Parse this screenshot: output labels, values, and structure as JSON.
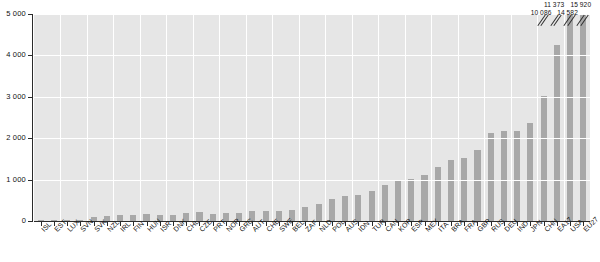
{
  "chart_data": {
    "type": "bar",
    "title": "",
    "subtitle": "",
    "xlabel": "",
    "ylabel": "",
    "ylim": [
      0,
      5000
    ],
    "grid": true,
    "legend": "none",
    "y_ticks": [
      "0",
      "1 000",
      "2 000",
      "3 000",
      "4 000",
      "5 000"
    ],
    "y_tick_values": [
      0,
      1000,
      2000,
      3000,
      4000,
      5000
    ],
    "bar_color": "#a8a8a8",
    "plot_background": "#e6e6e6",
    "gridline_color": "#ffffff",
    "axis_color": "#2b2b2b",
    "categories": [
      "ISL",
      "EST",
      "LUX",
      "SVN",
      "SVK",
      "NZL",
      "IRL",
      "FIN",
      "HUN",
      "ISR",
      "DNK",
      "CHL",
      "CZE",
      "PRT",
      "NOR",
      "GRC",
      "AUT",
      "CHE",
      "SWE",
      "BEL",
      "ZAF",
      "NLD",
      "POL",
      "AUS",
      "IDN",
      "TUR",
      "CAN",
      "KOR",
      "ESP",
      "MEX",
      "ITA",
      "BRA",
      "FRA",
      "GBR",
      "RUS",
      "DEU",
      "IND",
      "JPN",
      "CHN",
      "EA17",
      "USA",
      "EU27"
    ],
    "values": [
      12,
      18,
      22,
      30,
      95,
      110,
      145,
      150,
      160,
      140,
      150,
      185,
      215,
      180,
      190,
      205,
      230,
      235,
      250,
      255,
      340,
      420,
      540,
      610,
      640,
      720,
      860,
      960,
      1010,
      1115,
      1300,
      1480,
      1530,
      1720,
      2130,
      2170,
      2180,
      2360,
      3020,
      4250,
      5000,
      5000
    ],
    "clipped_bars": [
      {
        "category": "CHN",
        "index": 38,
        "label": "10 086"
      },
      {
        "category": "EA17",
        "index": 39,
        "label": "11 373"
      },
      {
        "category": "USA",
        "index": 40,
        "label": "14 582"
      },
      {
        "category": "EU27",
        "index": 41,
        "label": "15 920"
      }
    ]
  }
}
